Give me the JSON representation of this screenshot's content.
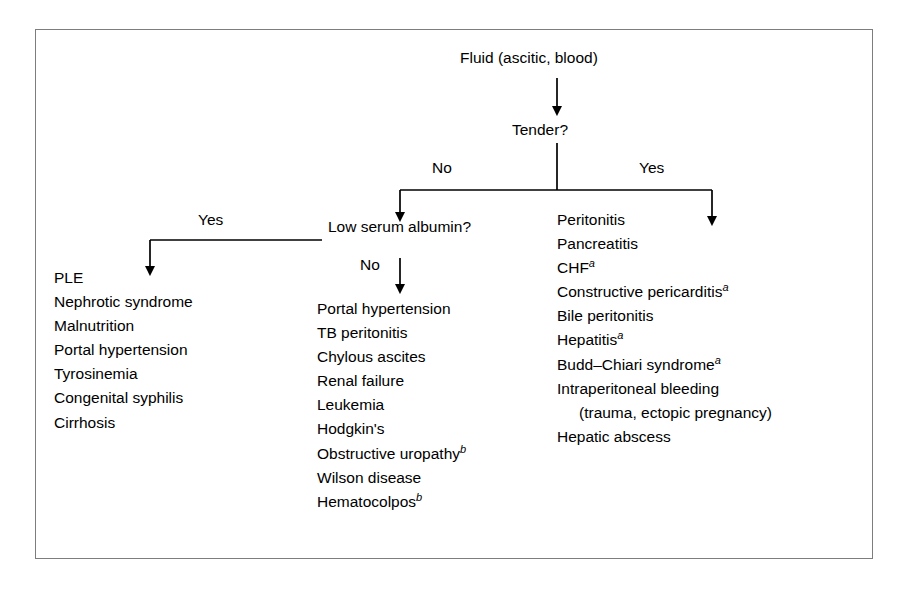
{
  "figure": {
    "root": "Fluid (ascitic, blood)",
    "decision_1": "Tender?",
    "decision_2": "Low serum albumin?",
    "labels": {
      "tender_no": "No",
      "tender_yes": "Yes",
      "albumin_yes": "Yes",
      "albumin_no": "No"
    },
    "columns": {
      "left": {
        "name": "low-albumin-yes-list",
        "items": [
          {
            "text": "PLE",
            "note": "",
            "indent": false
          },
          {
            "text": "Nephrotic syndrome",
            "note": "",
            "indent": false
          },
          {
            "text": "Malnutrition",
            "note": "",
            "indent": false
          },
          {
            "text": "Portal hypertension",
            "note": "",
            "indent": false
          },
          {
            "text": "Tyrosinemia",
            "note": "",
            "indent": false
          },
          {
            "text": "Congenital syphilis",
            "note": "",
            "indent": false
          },
          {
            "text": "Cirrhosis",
            "note": "",
            "indent": false
          }
        ]
      },
      "middle": {
        "name": "low-albumin-no-list",
        "items": [
          {
            "text": "Portal hypertension",
            "note": "",
            "indent": false
          },
          {
            "text": "TB peritonitis",
            "note": "",
            "indent": false
          },
          {
            "text": "Chylous ascites",
            "note": "",
            "indent": false
          },
          {
            "text": "Renal failure",
            "note": "",
            "indent": false
          },
          {
            "text": "Leukemia",
            "note": "",
            "indent": false
          },
          {
            "text": "Hodgkin's",
            "note": "",
            "indent": false
          },
          {
            "text": "Obstructive uropathy",
            "note": "b",
            "indent": false
          },
          {
            "text": "Wilson disease",
            "note": "",
            "indent": false
          },
          {
            "text": "Hematocolpos",
            "note": "b",
            "indent": false
          }
        ]
      },
      "right": {
        "name": "tender-yes-list",
        "items": [
          {
            "text": "Peritonitis",
            "note": "",
            "indent": false
          },
          {
            "text": "Pancreatitis",
            "note": "",
            "indent": false
          },
          {
            "text": "CHF",
            "note": "a",
            "indent": false
          },
          {
            "text": "Constructive pericarditis",
            "note": "a",
            "indent": false
          },
          {
            "text": "Bile peritonitis",
            "note": "",
            "indent": false
          },
          {
            "text": "Hepatitis",
            "note": "a",
            "indent": false
          },
          {
            "text": "Budd–Chiari syndrome",
            "note": "a",
            "indent": false
          },
          {
            "text": "Intraperitoneal bleeding",
            "note": "",
            "indent": false
          },
          {
            "text": "(trauma, ectopic pregnancy)",
            "note": "",
            "indent": true
          },
          {
            "text": "Hepatic abscess",
            "note": "",
            "indent": false
          }
        ]
      }
    },
    "colors": {
      "frame": "#7d7d7d",
      "ink": "#000000",
      "background": "#ffffff"
    }
  }
}
